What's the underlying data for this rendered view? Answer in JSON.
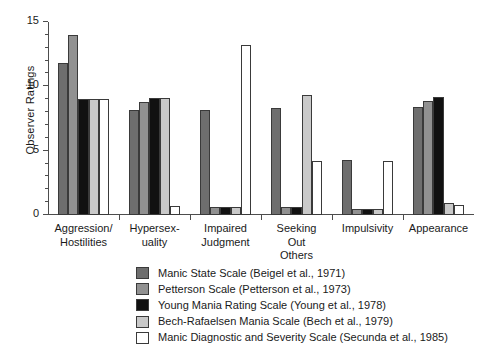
{
  "chart_data": {
    "type": "bar",
    "title": "",
    "xlabel": "",
    "ylabel": "Observer Ratings",
    "ylim": [
      0,
      15
    ],
    "yticks": [
      0,
      5,
      10,
      15
    ],
    "ytick_labels": [
      "0",
      "5",
      "10",
      "15"
    ],
    "yminor_step": 1,
    "grid": false,
    "legend_position": "bottom",
    "categories": [
      "Aggression/\nHostilities",
      "Hypersex-\nuality",
      "Impaired\nJudgment",
      "Seeking\nOut\nOthers",
      "Impulsivity",
      "Appearance"
    ],
    "series": [
      {
        "name": "Manic State Scale (Beigel et al., 1971)",
        "color": "#6e6e6e",
        "values": [
          11.8,
          8.2,
          8.2,
          8.3,
          4.3,
          8.4
        ]
      },
      {
        "name": "Petterson Scale (Petterson et al., 1973)",
        "color": "#919191",
        "values": [
          14.0,
          8.8,
          0.6,
          0.6,
          0.45,
          8.9
        ]
      },
      {
        "name": "Young Mania Rating Scale (Young et al., 1978)",
        "color": "#111111",
        "values": [
          9.0,
          9.1,
          0.6,
          0.6,
          0.45,
          9.2
        ]
      },
      {
        "name": "Bech-Rafaelsen Mania Scale (Bech et al., 1979)",
        "color": "#c9c9c9",
        "values": [
          9.0,
          9.1,
          0.6,
          9.3,
          0.45,
          0.9
        ]
      },
      {
        "name": "Manic Diagnostic and Severity Scale (Secunda et al., 1985)",
        "color": "#ffffff",
        "values": [
          9.0,
          0.7,
          13.2,
          4.2,
          4.2,
          0.8
        ]
      }
    ]
  },
  "legend": {
    "items": [
      {
        "label": "Manic State Scale (Beigel et al., 1971)",
        "color": "#6e6e6e"
      },
      {
        "label": "Petterson Scale (Petterson et al., 1973)",
        "color": "#919191"
      },
      {
        "label": "Young Mania Rating Scale (Young et al., 1978)",
        "color": "#111111"
      },
      {
        "label": "Bech-Rafaelsen Mania Scale (Bech et al., 1979)",
        "color": "#c9c9c9"
      },
      {
        "label": "Manic Diagnostic and Severity Scale (Secunda et al., 1985)",
        "color": "#ffffff"
      }
    ]
  },
  "axes": {
    "y_title": "Observer Ratings"
  }
}
